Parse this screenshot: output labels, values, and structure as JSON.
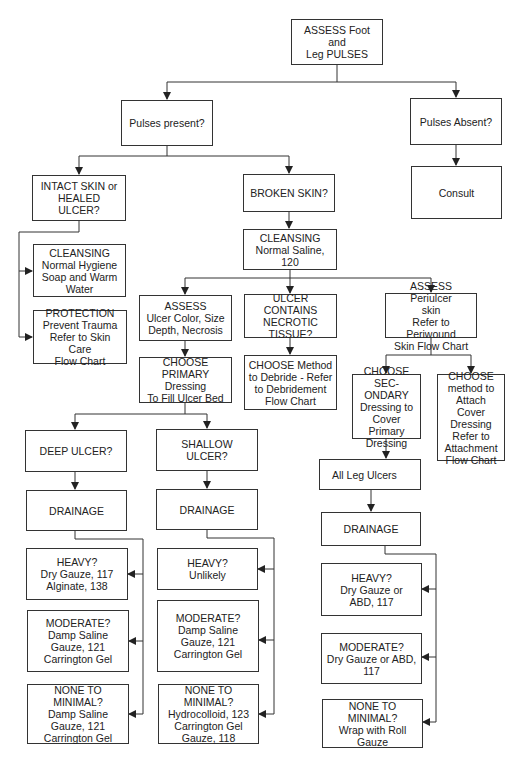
{
  "header_fragment": "",
  "nodes": {
    "root": [
      "ASSESS Foot and",
      "Leg PULSES"
    ],
    "pulses_present": [
      "Pulses present?"
    ],
    "pulses_absent": [
      "Pulses Absent?"
    ],
    "consult": [
      "Consult"
    ],
    "intact_skin": [
      "INTACT SKIN or",
      "HEALED ULCER?"
    ],
    "cleansing_hygiene": [
      "CLEANSING",
      "Normal Hygiene",
      "Soap and Warm",
      "Water"
    ],
    "protection": [
      "PROTECTION",
      "Prevent Trauma",
      "Refer to Skin Care",
      "Flow Chart"
    ],
    "broken_skin": [
      "BROKEN SKIN?"
    ],
    "cleansing_saline": [
      "CLEANSING",
      "Normal Saline, 120"
    ],
    "assess_ulcer": [
      "ASSESS",
      "Ulcer Color, Size",
      "Depth, Necrosis"
    ],
    "necrotic": [
      "ULCER CONTAINS",
      "NECROTIC TISSUE?"
    ],
    "assess_periulcer": [
      "ASSESS Periulcer",
      "skin",
      "Refer to Periwound",
      "Skin Flow Chart"
    ],
    "choose_primary": [
      "CHOOSE",
      "PRIMARY Dressing",
      "To Fill Ulcer Bed"
    ],
    "choose_debride": [
      "CHOOSE Method",
      "to Debride - Refer",
      "to Debridement",
      "Flow Chart"
    ],
    "choose_secondary": [
      "CHOOSE SEC-",
      "ONDARY",
      "Dressing to",
      "Cover Primary",
      "Dressing"
    ],
    "choose_attach": [
      "CHOOSE",
      "method to",
      "Attach Cover",
      "Dressing",
      "Refer to",
      "Attachment",
      "Flow Chart"
    ],
    "deep_ulcer": [
      "DEEP ULCER?"
    ],
    "shallow_ulcer": [
      "SHALLOW ULCER?"
    ],
    "all_leg_ulcers": [
      "All Leg Ulcers"
    ],
    "drainage_deep": [
      "DRAINAGE"
    ],
    "drainage_shallow": [
      "DRAINAGE"
    ],
    "drainage_leg": [
      "DRAINAGE"
    ],
    "heavy_deep": [
      "HEAVY?",
      "Dry Gauze, 117",
      "Alginate, 138"
    ],
    "heavy_shallow": [
      "HEAVY?",
      "Unlikely"
    ],
    "heavy_leg": [
      "HEAVY?",
      "Dry Gauze or",
      "ABD, 117"
    ],
    "moderate_deep": [
      "MODERATE?",
      "Damp Saline",
      "Gauze, 121",
      "Carrington Gel"
    ],
    "moderate_shallow": [
      "MODERATE?",
      "Damp Saline",
      "Gauze, 121",
      "Carrington Gel"
    ],
    "moderate_leg": [
      "MODERATE?",
      "Dry Gauze or ABD, 117"
    ],
    "none_deep": [
      "NONE TO MINIMAL?",
      "Damp Saline",
      "Gauze, 121",
      "Carrington Gel"
    ],
    "none_shallow": [
      "NONE TO MINIMAL?",
      "Hydrocolloid, 123",
      "Carrington Gel",
      "Gauze, 118"
    ],
    "none_leg": [
      "NONE TO MINIMAL?",
      "Wrap with Roll Gauze"
    ]
  },
  "colors": {
    "line": "#333333",
    "background": "#ffffff"
  }
}
